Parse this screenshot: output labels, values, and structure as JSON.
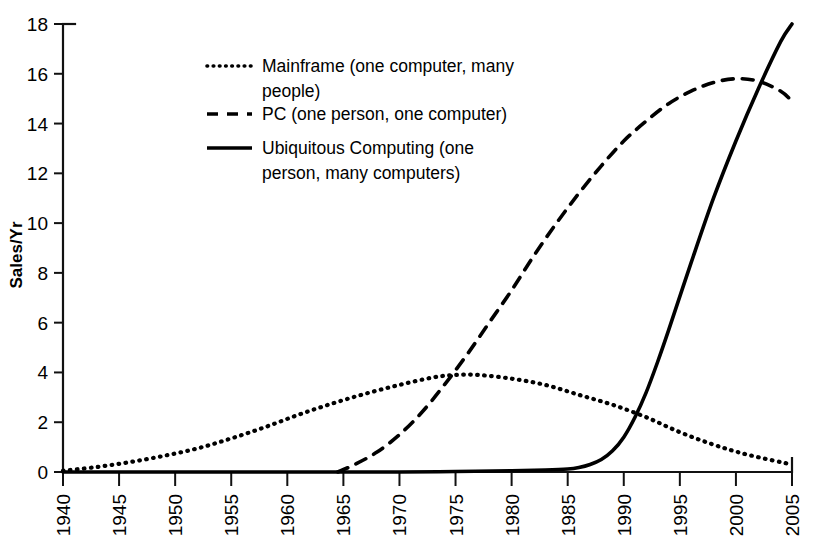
{
  "chart_data": {
    "type": "line",
    "title": "",
    "xlabel": "",
    "ylabel": "Sales/Yr",
    "xlim": [
      1940,
      2005
    ],
    "ylim": [
      0,
      18
    ],
    "ytick_step": 2,
    "xtick_step": 5,
    "grid": false,
    "legend_position": "upper-left-inside",
    "xticks": [
      "1940",
      "1945",
      "1950",
      "1955",
      "1960",
      "1965",
      "1970",
      "1975",
      "1980",
      "1985",
      "1990",
      "1995",
      "2000",
      "2005"
    ],
    "yticks": [
      "0",
      "2",
      "4",
      "6",
      "8",
      "10",
      "12",
      "14",
      "16",
      "18"
    ],
    "series": [
      {
        "name": "Mainframe (one computer, many people)",
        "style": "dotted",
        "x": [
          1940,
          1943,
          1946,
          1949,
          1952,
          1955,
          1958,
          1961,
          1964,
          1967,
          1970,
          1973,
          1975,
          1977,
          1980,
          1983,
          1986,
          1989,
          1992,
          1995,
          1998,
          2001,
          2005
        ],
        "values": [
          0.05,
          0.2,
          0.4,
          0.65,
          0.95,
          1.35,
          1.8,
          2.3,
          2.75,
          3.15,
          3.5,
          3.8,
          3.9,
          3.9,
          3.75,
          3.5,
          3.1,
          2.7,
          2.2,
          1.6,
          1.1,
          0.7,
          0.3
        ]
      },
      {
        "name": "PC (one person, one computer)",
        "style": "dashed",
        "x": [
          1964.5,
          1966,
          1968,
          1970,
          1972,
          1974,
          1976,
          1978,
          1980,
          1982,
          1984,
          1986,
          1988,
          1990,
          1992,
          1994,
          1996,
          1998,
          2000,
          2002,
          2004,
          2005
        ],
        "values": [
          0.0,
          0.3,
          0.8,
          1.5,
          2.4,
          3.5,
          4.7,
          6.0,
          7.3,
          8.7,
          10.0,
          11.2,
          12.3,
          13.3,
          14.1,
          14.8,
          15.3,
          15.65,
          15.8,
          15.7,
          15.3,
          14.9
        ]
      },
      {
        "name": "Ubiquitous Computing (one person, many computers)",
        "style": "solid",
        "x": [
          1940,
          1950,
          1960,
          1970,
          1975,
          1980,
          1983,
          1985,
          1986,
          1987,
          1988,
          1989,
          1990,
          1991,
          1992,
          1993,
          1994,
          1996,
          1998,
          2000,
          2002,
          2004,
          2005
        ],
        "values": [
          0.0,
          0.0,
          0.0,
          0.0,
          0.02,
          0.05,
          0.08,
          0.12,
          0.18,
          0.3,
          0.5,
          0.85,
          1.4,
          2.2,
          3.2,
          4.4,
          5.7,
          8.4,
          11.0,
          13.3,
          15.4,
          17.3,
          18.0
        ]
      }
    ],
    "legend": [
      {
        "marker": "dotted",
        "label": "Mainframe (one computer, many people)"
      },
      {
        "marker": "dashed",
        "label": "PC (one person, one computer)"
      },
      {
        "marker": "solid",
        "label": "Ubiquitous Computing (one person, many computers)"
      }
    ],
    "colors": {
      "ink": "#000000",
      "axis": "#111111",
      "background": "#ffffff"
    }
  }
}
